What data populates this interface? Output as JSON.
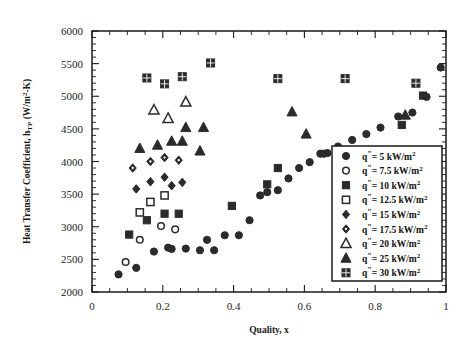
{
  "chart_data": {
    "type": "scatter",
    "title": "",
    "xlabel": "Quality, x",
    "ylabel": "Heat Transfer Coefficient, h_TP (W/m²-K)",
    "xlim": [
      0,
      1
    ],
    "ylim": [
      2000,
      6000
    ],
    "xticks": [
      "0",
      "0.2",
      "0.4",
      "0.6",
      "0.8",
      "1"
    ],
    "xtick_values": [
      0,
      0.2,
      0.4,
      0.6,
      0.8,
      1
    ],
    "yticks": [
      "2000",
      "2500",
      "3000",
      "3500",
      "4000",
      "4500",
      "5000",
      "5500",
      "6000"
    ],
    "ytick_values": [
      2000,
      2500,
      3000,
      3500,
      4000,
      4500,
      5000,
      5500,
      6000
    ],
    "grid": false,
    "legend_position": "lower-right-inside",
    "series": [
      {
        "name": "q\"= 5 kW/m²",
        "marker": "filled-circle",
        "points": [
          [
            0.075,
            2270
          ],
          [
            0.125,
            2370
          ],
          [
            0.175,
            2620
          ],
          [
            0.215,
            2680
          ],
          [
            0.225,
            2660
          ],
          [
            0.265,
            2665
          ],
          [
            0.305,
            2640
          ],
          [
            0.345,
            2640
          ],
          [
            0.325,
            2800
          ],
          [
            0.375,
            2870
          ],
          [
            0.415,
            2870
          ],
          [
            0.445,
            3100
          ],
          [
            0.475,
            3480
          ],
          [
            0.495,
            3530
          ],
          [
            0.525,
            3560
          ],
          [
            0.555,
            3740
          ],
          [
            0.585,
            3900
          ],
          [
            0.615,
            3990
          ],
          [
            0.645,
            4120
          ],
          [
            0.655,
            4120
          ],
          [
            0.665,
            4130
          ],
          [
            0.695,
            4230
          ],
          [
            0.735,
            4330
          ],
          [
            0.775,
            4420
          ],
          [
            0.815,
            4520
          ],
          [
            0.865,
            4690
          ],
          [
            0.905,
            4750
          ],
          [
            0.945,
            4990
          ],
          [
            0.985,
            5440
          ]
        ]
      },
      {
        "name": "q\"= 7.5 kW/m²",
        "marker": "open-circle",
        "points": [
          [
            0.095,
            2460
          ],
          [
            0.135,
            2800
          ],
          [
            0.195,
            3010
          ],
          [
            0.235,
            2960
          ]
        ]
      },
      {
        "name": "q\"= 10 kW/m²",
        "marker": "filled-square",
        "points": [
          [
            0.105,
            2880
          ],
          [
            0.155,
            3100
          ],
          [
            0.205,
            3200
          ],
          [
            0.245,
            3200
          ],
          [
            0.395,
            3320
          ],
          [
            0.495,
            3650
          ],
          [
            0.525,
            3900
          ],
          [
            0.875,
            4560
          ],
          [
            0.935,
            5010
          ]
        ]
      },
      {
        "name": "q\"= 12.5 kW/m²",
        "marker": "open-square",
        "points": [
          [
            0.135,
            3220
          ],
          [
            0.165,
            3380
          ],
          [
            0.205,
            3480
          ]
        ]
      },
      {
        "name": "q\"= 15 kW/m²",
        "marker": "filled-diamond",
        "points": [
          [
            0.125,
            3580
          ],
          [
            0.165,
            3690
          ],
          [
            0.205,
            3760
          ],
          [
            0.225,
            3630
          ],
          [
            0.255,
            3680
          ]
        ]
      },
      {
        "name": "q\"= 17.5 kW/m²",
        "marker": "dotted-diamond",
        "points": [
          [
            0.115,
            3900
          ],
          [
            0.165,
            4000
          ],
          [
            0.205,
            4060
          ],
          [
            0.245,
            4020
          ]
        ]
      },
      {
        "name": "q\"= 20 kW/m²",
        "marker": "open-triangle",
        "points": [
          [
            0.175,
            4790
          ],
          [
            0.215,
            4660
          ],
          [
            0.265,
            4910
          ]
        ]
      },
      {
        "name": "q\"= 25 kW/m²",
        "marker": "filled-triangle",
        "points": [
          [
            0.135,
            4200
          ],
          [
            0.185,
            4250
          ],
          [
            0.225,
            4310
          ],
          [
            0.265,
            4520
          ],
          [
            0.255,
            4310
          ],
          [
            0.305,
            4160
          ],
          [
            0.315,
            4520
          ],
          [
            0.565,
            4760
          ],
          [
            0.605,
            4420
          ],
          [
            0.885,
            4710
          ]
        ]
      },
      {
        "name": "q\"= 30 kW/m²",
        "marker": "gridded-square",
        "points": [
          [
            0.155,
            5280
          ],
          [
            0.205,
            5190
          ],
          [
            0.255,
            5300
          ],
          [
            0.335,
            5510
          ],
          [
            0.525,
            5270
          ],
          [
            0.715,
            5270
          ],
          [
            0.915,
            5200
          ]
        ]
      }
    ]
  },
  "legend": {
    "entries": [
      {
        "label": "q\"= 5 kW/m²",
        "marker": "filled-circle"
      },
      {
        "label": "q\"= 7.5 kW/m²",
        "marker": "open-circle"
      },
      {
        "label": "q\"= 10 kW/m²",
        "marker": "filled-square"
      },
      {
        "label": "q\"= 12.5 kW/m²",
        "marker": "open-square"
      },
      {
        "label": "q\"= 15 kW/m²",
        "marker": "filled-diamond"
      },
      {
        "label": "q\"= 17.5 kW/m²",
        "marker": "dotted-diamond"
      },
      {
        "label": "q\"= 20 kW/m²",
        "marker": "open-triangle"
      },
      {
        "label": "q\"= 25 kW/m²",
        "marker": "filled-triangle"
      },
      {
        "label": "q\"= 30 kW/m²",
        "marker": "gridded-square"
      }
    ]
  },
  "colors": {
    "marker": "#2b2b2b",
    "axis": "#1a1a1a",
    "background": "#ffffff"
  }
}
